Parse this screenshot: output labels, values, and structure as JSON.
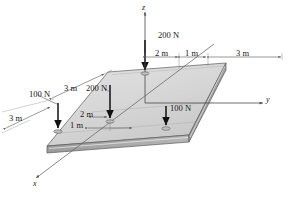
{
  "figure": {
    "type": "engineering-statics-3d-plate-diagram",
    "background_color": "#ffffff",
    "plate": {
      "top_face_color": "#d2d2d2",
      "top_face_color_light": "#e0e0e0",
      "edge_face_color": "#a8a8a8",
      "front_face_color": "#b8b8b8",
      "outline_color": "#4a4a4a"
    },
    "axes": [
      {
        "name": "z",
        "label": "z",
        "direction": "up"
      },
      {
        "name": "y",
        "label": "y",
        "direction": "right"
      },
      {
        "name": "x",
        "label": "x",
        "direction": "lower-left"
      }
    ],
    "loads": [
      {
        "name": "load-200n-far",
        "label": "200 N",
        "magnitude": 200,
        "unit": "N",
        "direction": "down"
      },
      {
        "name": "load-200n-near",
        "label": "200 N",
        "magnitude": 200,
        "unit": "N",
        "direction": "down"
      },
      {
        "name": "load-100n-left",
        "label": "100 N",
        "magnitude": 100,
        "unit": "N",
        "direction": "down"
      },
      {
        "name": "load-100n-right",
        "label": "100 N",
        "magnitude": 100,
        "unit": "N",
        "direction": "down"
      }
    ],
    "dimensions": [
      {
        "name": "dim-2m-top",
        "label": "2 m",
        "value": 2,
        "unit": "m"
      },
      {
        "name": "dim-1m-top",
        "label": "1 m",
        "value": 1,
        "unit": "m"
      },
      {
        "name": "dim-3m-top-right",
        "label": "3 m",
        "value": 3,
        "unit": "m"
      },
      {
        "name": "dim-3m-upper-left",
        "label": "3 m",
        "value": 3,
        "unit": "m"
      },
      {
        "name": "dim-3m-lower-left",
        "label": "3 m",
        "value": 3,
        "unit": "m"
      },
      {
        "name": "dim-2m-lower",
        "label": "2 m",
        "value": 2,
        "unit": "m"
      },
      {
        "name": "dim-1m-lower",
        "label": "1 m",
        "value": 1,
        "unit": "m"
      }
    ]
  }
}
